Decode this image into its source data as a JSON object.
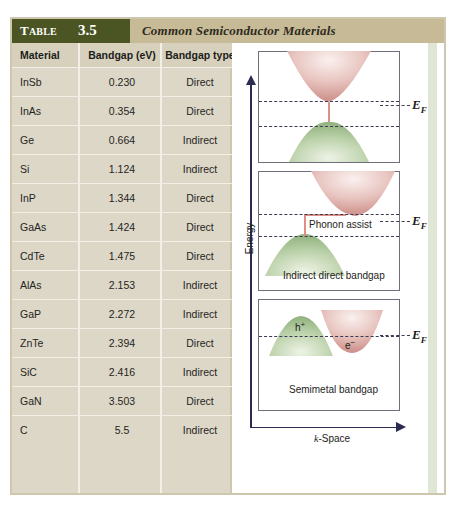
{
  "figure": {
    "table_badge_word": "T",
    "table_badge_word_small": "ABLE",
    "table_number": "3.5",
    "title": "Common Semiconductor Materials",
    "colors": {
      "badge_green": "#4b5524",
      "title_tan": "#c7bb97",
      "table_bg": "#dcd7c6",
      "frame_tan": "#cfc7ad",
      "conduction_pink": "#d9a09b",
      "valence_green": "#a8c49a",
      "axis_navy": "#2c2c52"
    }
  },
  "table": {
    "columns": [
      "Material",
      "Bandgap (eV)",
      "Bandgap type"
    ],
    "rows": [
      {
        "material": "InSb",
        "bandgap": "0.230",
        "type": "Direct"
      },
      {
        "material": "InAs",
        "bandgap": "0.354",
        "type": "Direct"
      },
      {
        "material": "Ge",
        "bandgap": "0.664",
        "type": "Indirect"
      },
      {
        "material": "Si",
        "bandgap": "1.124",
        "type": "Indirect"
      },
      {
        "material": "InP",
        "bandgap": "1.344",
        "type": "Direct"
      },
      {
        "material": "GaAs",
        "bandgap": "1.424",
        "type": "Direct"
      },
      {
        "material": "CdTe",
        "bandgap": "1.475",
        "type": "Direct"
      },
      {
        "material": "AlAs",
        "bandgap": "2.153",
        "type": "Indirect"
      },
      {
        "material": "GaP",
        "bandgap": "2.272",
        "type": "Indirect"
      },
      {
        "material": "ZnTe",
        "bandgap": "2.394",
        "type": "Direct"
      },
      {
        "material": "SiC",
        "bandgap": "2.416",
        "type": "Indirect"
      },
      {
        "material": "GaN",
        "bandgap": "3.503",
        "type": "Direct"
      },
      {
        "material": "C",
        "bandgap": "5.5",
        "type": "Indirect"
      }
    ]
  },
  "diagram": {
    "y_axis_label": "Energy",
    "x_axis_label_italic": "k",
    "x_axis_label_rest": "-Space",
    "fermi_label": "E",
    "fermi_subscript": "F",
    "panels": [
      {
        "name": "direct-bandgap",
        "caption": ""
      },
      {
        "name": "indirect-bandgap",
        "caption": "Indirect direct bandgap",
        "annotation": "Phonon assist"
      },
      {
        "name": "semimetal-bandgap",
        "caption": "Semimetal bandgap",
        "hole_label": "h",
        "hole_sup": "+",
        "electron_label": "e",
        "electron_sup": "−"
      }
    ]
  }
}
